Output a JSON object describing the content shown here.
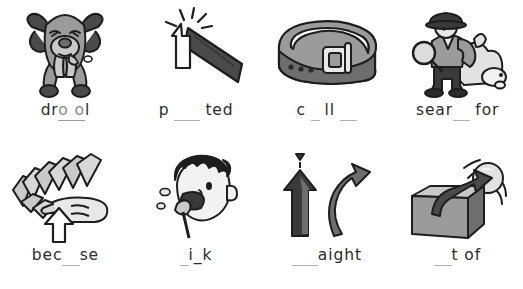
{
  "worksheet": {
    "background_color": "#ffffff",
    "text_color": "#2b2b2b",
    "blank_color": "#b0b0b0",
    "answer_color": "#8a8a8a",
    "grey_light": "#c9c9c9",
    "grey_mid": "#9b9b9b",
    "grey_dark": "#4a4a4a",
    "ink": "#1d1d1d",
    "items": [
      {
        "id": "item-drool",
        "icon": "drooling-dog-icon",
        "picture_description": "cartoon dog with floppy ears and tongue out, drooling",
        "prefix": "dr",
        "answer": "o o",
        "suffix": "l",
        "blank": "",
        "display_word": "dr o o l",
        "answer_filled": true
      },
      {
        "id": "item-pointed",
        "icon": "pointed-object-icon",
        "picture_description": "dark tapered spike with arrow pointing at its sharp tip and sparkle lines",
        "prefix": "p",
        "answer": "",
        "suffix": "ted",
        "blank": "___",
        "display_word": "p ___ ted",
        "answer_filled": false
      },
      {
        "id": "item-collar",
        "icon": "belt-collar-icon",
        "picture_description": "grey leather belt or collar with metal buckle and punch holes",
        "prefix": "c",
        "answer": "",
        "suffix": "ll",
        "blank": "_",
        "blank2": "__",
        "display_word": "c _ ll __",
        "answer_filled": false
      },
      {
        "id": "item-search-for",
        "icon": "detective-searching-icon",
        "picture_description": "detective in deerstalker hat with magnifying glass searching beside a white dog",
        "prefix": "sear",
        "answer": "",
        "suffix": "for",
        "blank": "__",
        "display_word": "sear__ for",
        "answer_filled": false
      },
      {
        "id": "item-because",
        "icon": "falling-dominoes-icon",
        "picture_description": "hand with pointing finger pushing a row of falling dominoes, arrow pointing up at finger",
        "prefix": "bec",
        "answer": "",
        "suffix": "se",
        "blank": "__",
        "display_word": "bec__se",
        "answer_filled": false
      },
      {
        "id": "item-drink",
        "icon": "boy-drinking-icon",
        "picture_description": "boy with dark spiky hair drinking from a cup or straw",
        "prefix": "",
        "answer": "",
        "suffix": "i_k",
        "blank": "_",
        "display_word": "_i_k",
        "answer_filled": false
      },
      {
        "id": "item-straight",
        "icon": "straight-and-curved-arrow-icon",
        "picture_description": "one straight vertical arrow next to one curved arrow",
        "prefix": "",
        "answer": "",
        "suffix": "aight",
        "blank": "___",
        "display_word": "___aight",
        "answer_filled": false
      },
      {
        "id": "item-out-of",
        "icon": "ball-out-of-box-icon",
        "picture_description": "ball flying up out of an open cardboard box with a curved arrow",
        "prefix": "",
        "answer": "",
        "suffix": "t of",
        "blank": "__",
        "display_word": "__t of",
        "answer_filled": false
      }
    ]
  }
}
